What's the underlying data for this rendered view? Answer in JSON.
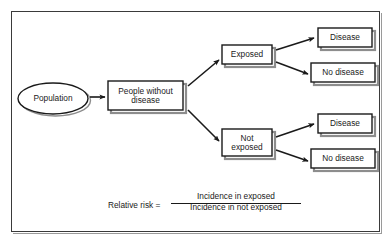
{
  "figure": {
    "background_color": "#ffffff",
    "frame_color": "#3a3a3a",
    "shadow_color": "#9a9a9a",
    "text_color": "#1a1a1a"
  },
  "nodes": {
    "population": {
      "label": "Population",
      "shape": "ellipse"
    },
    "people_without_disease": {
      "label": "People without\ndisease",
      "shape": "rect"
    },
    "exposed": {
      "label": "Exposed",
      "shape": "rect"
    },
    "not_exposed": {
      "label": "Not\nexposed",
      "shape": "rect"
    },
    "exposed_disease": {
      "label": "Disease",
      "shape": "rect"
    },
    "exposed_no_disease": {
      "label": "No disease",
      "shape": "rect"
    },
    "not_exposed_disease": {
      "label": "Disease",
      "shape": "rect"
    },
    "not_exposed_no_disease": {
      "label": "No disease",
      "shape": "rect"
    }
  },
  "formula": {
    "lhs": "Relative risk =",
    "numerator": "Incidence in exposed",
    "denominator": "Incidence in not exposed"
  },
  "edges": [
    {
      "from": "population",
      "to": "people_without_disease",
      "style": "straight-arrow"
    },
    {
      "from": "people_without_disease",
      "to": "exposed",
      "style": "diagonal-arrow-up"
    },
    {
      "from": "people_without_disease",
      "to": "not_exposed",
      "style": "diagonal-arrow-down"
    },
    {
      "from": "exposed",
      "to": "exposed_disease",
      "style": "diagonal-arrow-up"
    },
    {
      "from": "exposed",
      "to": "exposed_no_disease",
      "style": "diagonal-arrow-down"
    },
    {
      "from": "not_exposed",
      "to": "not_exposed_disease",
      "style": "diagonal-arrow-up"
    },
    {
      "from": "not_exposed",
      "to": "not_exposed_no_disease",
      "style": "diagonal-arrow-down"
    }
  ]
}
